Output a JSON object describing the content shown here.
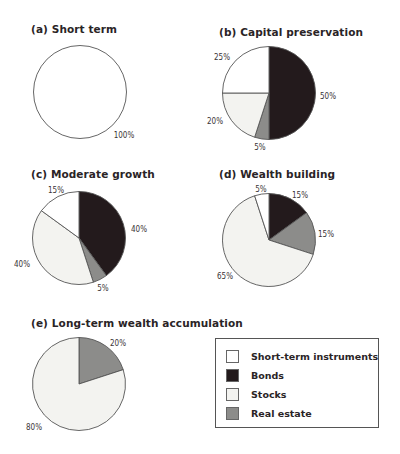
{
  "colors": {
    "short_term": "#ffffff",
    "bonds": "#231a1c",
    "stocks": "#f3f3f0",
    "real_estate": "#8c8c8a",
    "outline": "#555555"
  },
  "legend": {
    "items": [
      {
        "label": "Short-term instruments",
        "color": "#ffffff"
      },
      {
        "label": "Bonds",
        "color": "#231a1c"
      },
      {
        "label": "Stocks",
        "color": "#f3f3f0"
      },
      {
        "label": "Real estate",
        "color": "#8c8c8a"
      }
    ]
  },
  "chart_data": [
    {
      "type": "pie",
      "title": "(a) Short term",
      "categories": [
        "Short-term instruments"
      ],
      "values": [
        100
      ],
      "labels": [
        "100%"
      ]
    },
    {
      "type": "pie",
      "title": "(b) Capital preservation",
      "categories": [
        "Bonds",
        "Real estate",
        "Stocks",
        "Short-term instruments"
      ],
      "values": [
        50,
        5,
        20,
        25
      ],
      "labels": [
        "50%",
        "5%",
        "20%",
        "25%"
      ]
    },
    {
      "type": "pie",
      "title": "(c) Moderate growth",
      "categories": [
        "Bonds",
        "Real estate",
        "Stocks",
        "Short-term instruments"
      ],
      "values": [
        40,
        5,
        40,
        15
      ],
      "labels": [
        "40%",
        "5%",
        "40%",
        "15%"
      ]
    },
    {
      "type": "pie",
      "title": "(d) Wealth building",
      "categories": [
        "Bonds",
        "Real estate",
        "Stocks",
        "Short-term instruments"
      ],
      "values": [
        15,
        15,
        65,
        5
      ],
      "labels": [
        "15%",
        "15%",
        "65%",
        "5%"
      ]
    },
    {
      "type": "pie",
      "title": "(e) Long-term wealth accumulation",
      "categories": [
        "Real estate",
        "Stocks"
      ],
      "values": [
        20,
        80
      ],
      "labels": [
        "20%",
        "80%"
      ]
    }
  ]
}
